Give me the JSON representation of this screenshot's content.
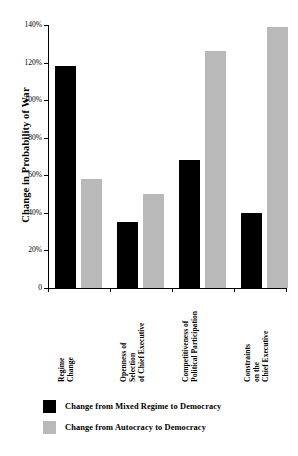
{
  "chart_data": {
    "type": "bar",
    "title": "",
    "xlabel": "",
    "ylabel": "Change in Probability of War",
    "categories": [
      "Regime Change",
      "Openness of Selection of Chief Executive",
      "Competitiveness of Political Participation",
      "Constraints on the Chief Executive"
    ],
    "category_lines": [
      [
        "Regime",
        "Change"
      ],
      [
        "Openness of",
        "Selection",
        "of Chief Executive"
      ],
      [
        "Competitiveness of",
        "Political Participation"
      ],
      [
        "Constraints",
        "on the",
        "Chief Executive"
      ]
    ],
    "series": [
      {
        "name": "Change from Mixed Regime to Democracy",
        "color": "#000000",
        "values": [
          118,
          35,
          68,
          40
        ]
      },
      {
        "name": "Change from Autocracy to Democracy",
        "color": "#b9b9b9",
        "values": [
          58,
          50,
          126,
          139
        ]
      }
    ],
    "ylim": [
      0,
      140
    ],
    "ytick_values": [
      0,
      20,
      40,
      60,
      80,
      100,
      120,
      140
    ],
    "ytick_labels": [
      "0",
      "20%",
      "40%",
      "60%",
      "80%",
      "100%",
      "120%",
      "140%"
    ],
    "grid": false,
    "legend_position": "bottom-left"
  },
  "axis": {
    "y_title": "Change in Probability of War",
    "ticks": [
      {
        "value": 140,
        "label": "140%"
      },
      {
        "value": 120,
        "label": "120%"
      },
      {
        "value": 100,
        "label": "100%"
      },
      {
        "value": 80,
        "label": "80%"
      },
      {
        "value": 60,
        "label": "60%"
      },
      {
        "value": 40,
        "label": "40%"
      },
      {
        "value": 20,
        "label": "20%"
      },
      {
        "value": 0,
        "label": "0"
      }
    ]
  },
  "legend": {
    "items": [
      {
        "label": "Change from Mixed Regime to Democracy",
        "color": "#000000"
      },
      {
        "label": "Change from Autocracy to Democracy",
        "color": "#b9b9b9"
      }
    ]
  }
}
